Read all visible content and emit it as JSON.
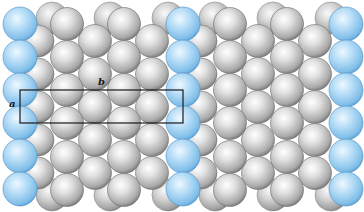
{
  "figure": {
    "colors": {
      "gray_light": "#f2f2f2",
      "gray_mid": "#bdbdbd",
      "gray_dark": "#7d7d7d",
      "blue_light": "#d6ecfb",
      "blue_mid": "#9fd0f2",
      "blue_dark": "#5aa6dc",
      "cell_outline": "#1a1a1a"
    },
    "unit_cell": {
      "x": 20,
      "y": 90,
      "width": 163,
      "height": 33,
      "label_a": "a",
      "label_b": "b"
    },
    "repeat_period_x": 163,
    "blue_columns_x": [
      20,
      183,
      346
    ],
    "blue_rows_y": [
      24,
      57,
      90,
      123,
      156,
      189
    ]
  }
}
